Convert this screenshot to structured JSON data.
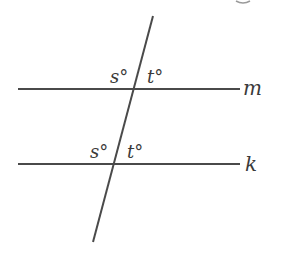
{
  "diagram": {
    "type": "parallel lines cut by a transversal",
    "colors": {
      "line": "#4a4a4a",
      "text": "#3a3a3a",
      "background": "#ffffff"
    },
    "lines": [
      {
        "id": "m",
        "label": "m",
        "x1": 18,
        "y1": 89,
        "x2": 240,
        "y2": 89
      },
      {
        "id": "k",
        "label": "k",
        "x1": 18,
        "y1": 164,
        "x2": 240,
        "y2": 164
      },
      {
        "id": "transversal",
        "label": "",
        "x1": 153,
        "y1": 16,
        "x2": 93,
        "y2": 242
      }
    ],
    "angle_labels": [
      {
        "at_line": "m",
        "position": "upper-left",
        "text": "s°"
      },
      {
        "at_line": "m",
        "position": "upper-right",
        "text": "t°"
      },
      {
        "at_line": "k",
        "position": "upper-left",
        "text": "s°"
      },
      {
        "at_line": "k",
        "position": "upper-right",
        "text": "t°"
      }
    ]
  },
  "labels": {
    "m": "m",
    "k": "k",
    "m_left": "s°",
    "m_right": "t°",
    "k_left": "s°",
    "k_right": "t°"
  }
}
